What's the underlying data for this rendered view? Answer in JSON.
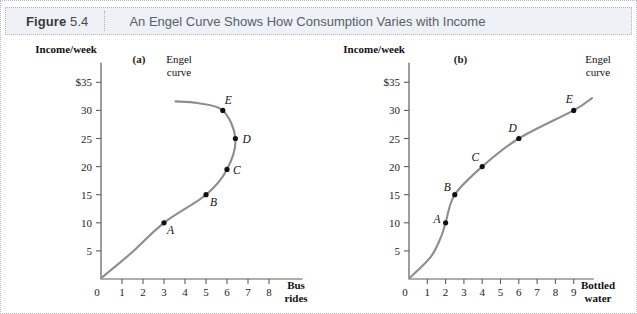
{
  "header": {
    "figure_word": "Figure",
    "figure_number": "5.4",
    "title": "An Engel Curve Shows How Consumption Varies with Income"
  },
  "panels": [
    {
      "label": "(a)"
    },
    {
      "label": "(b)"
    }
  ],
  "chart_data": [
    {
      "type": "line",
      "panel": "(a)",
      "title": "",
      "xlabel": "Bus rides",
      "xlabel_line1": "Bus",
      "xlabel_line2": "rides",
      "ylabel": "Income/week",
      "curve_label_line1": "Engel",
      "curve_label_line2": "curve",
      "xlim": [
        0,
        9
      ],
      "ylim": [
        0,
        38
      ],
      "grid": false,
      "origin_label": "0",
      "xticks": [
        1,
        2,
        3,
        4,
        5,
        6,
        7,
        8
      ],
      "xtick_labels": [
        "1",
        "2",
        "3",
        "4",
        "5",
        "6",
        "7",
        "8"
      ],
      "yticks": [
        5,
        10,
        15,
        20,
        25,
        30,
        35
      ],
      "ytick_labels": [
        "5",
        "10",
        "15",
        "20",
        "25",
        "30",
        "$35"
      ],
      "points": [
        {
          "name": "A",
          "x": 3.0,
          "y": 10
        },
        {
          "name": "B",
          "x": 5.0,
          "y": 15
        },
        {
          "name": "C",
          "x": 6.0,
          "y": 19.5
        },
        {
          "name": "D",
          "x": 6.4,
          "y": 25
        },
        {
          "name": "E",
          "x": 5.8,
          "y": 30
        }
      ],
      "note": "backward-bending Engel curve: bus rides become an inferior good above point D"
    },
    {
      "type": "line",
      "panel": "(b)",
      "title": "",
      "xlabel": "Bottled water",
      "xlabel_line1": "Bottled",
      "xlabel_line2": "water",
      "ylabel": "Income/week",
      "curve_label_line1": "Engel",
      "curve_label_line2": "curve",
      "xlim": [
        0,
        10
      ],
      "ylim": [
        0,
        38
      ],
      "grid": false,
      "origin_label": "0",
      "xticks": [
        1,
        2,
        3,
        4,
        5,
        6,
        7,
        8,
        9
      ],
      "xtick_labels": [
        "1",
        "2",
        "3",
        "4",
        "5",
        "6",
        "7",
        "8",
        "9"
      ],
      "yticks": [
        5,
        10,
        15,
        20,
        25,
        30,
        35
      ],
      "ytick_labels": [
        "5",
        "10",
        "15",
        "20",
        "25",
        "30",
        "$35"
      ],
      "points": [
        {
          "name": "A",
          "x": 2.0,
          "y": 10
        },
        {
          "name": "B",
          "x": 2.5,
          "y": 15
        },
        {
          "name": "C",
          "x": 4.0,
          "y": 20
        },
        {
          "name": "D",
          "x": 6.0,
          "y": 25
        },
        {
          "name": "E",
          "x": 9.0,
          "y": 30
        }
      ],
      "note": "upward-sloping Engel curve: bottled water is a normal good"
    }
  ],
  "colors": {
    "curve": "#8d8d8d",
    "point": "#111111",
    "axis": "#5e5e5e",
    "header_bg": "#eef1f5",
    "header_text": "#55606b"
  }
}
